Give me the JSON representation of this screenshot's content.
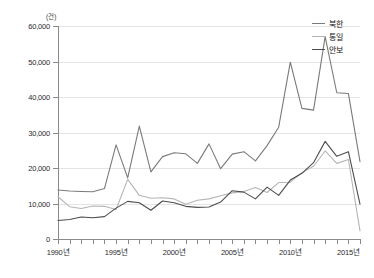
{
  "chart_data": {
    "type": "line",
    "title": "",
    "subtitle": "",
    "xlabel": "",
    "ylabel": "",
    "unit_label": "(건)",
    "grid": true,
    "legend_position": "top-right",
    "xlim": [
      1990,
      2016
    ],
    "ylim": [
      0,
      60000
    ],
    "y_ticks": [
      0,
      10000,
      20000,
      30000,
      40000,
      50000,
      60000
    ],
    "y_tick_labels": [
      "0",
      "10,000",
      "20,000",
      "30,000",
      "40,000",
      "50,000",
      "60,000"
    ],
    "x_tick_labels": [
      "1990년",
      "1995년",
      "2000년",
      "2005년",
      "2010년",
      "2015년"
    ],
    "x_tick_values": [
      1990,
      1995,
      2000,
      2005,
      2010,
      2015
    ],
    "x": [
      1990,
      1991,
      1992,
      1993,
      1994,
      1995,
      1996,
      1997,
      1998,
      1999,
      2000,
      2001,
      2002,
      2003,
      2004,
      2005,
      2006,
      2007,
      2008,
      2009,
      2010,
      2011,
      2012,
      2013,
      2014,
      2015,
      2016
    ],
    "series": [
      {
        "name": "북한",
        "color": "#7a7a7a",
        "values": [
          13800,
          13500,
          13400,
          13300,
          14200,
          26500,
          17200,
          31800,
          18900,
          23200,
          24300,
          24000,
          21300,
          26800,
          19800,
          23900,
          24600,
          22000,
          26300,
          31500,
          49800,
          36800,
          36300,
          57000,
          41200,
          41000,
          21800
        ]
      },
      {
        "name": "통일",
        "color": "#b5b5b5",
        "values": [
          11900,
          9100,
          8600,
          9300,
          9200,
          8300,
          16800,
          12300,
          11500,
          11600,
          11300,
          9800,
          10900,
          11300,
          12200,
          13000,
          13400,
          14500,
          13100,
          15900,
          16000,
          18700,
          20500,
          24800,
          21300,
          22400,
          2300
        ]
      },
      {
        "name": "안보",
        "color": "#4d4d4d",
        "values": [
          5200,
          5500,
          6200,
          6000,
          6300,
          8700,
          10600,
          10200,
          8100,
          10700,
          10200,
          9200,
          8900,
          9000,
          10400,
          13600,
          13200,
          11300,
          14600,
          12300,
          16600,
          18500,
          21500,
          27500,
          23300,
          24600,
          9800
        ]
      }
    ]
  },
  "legend": {
    "items": [
      {
        "label": "북한"
      },
      {
        "label": "통일"
      },
      {
        "label": "안보"
      }
    ]
  }
}
